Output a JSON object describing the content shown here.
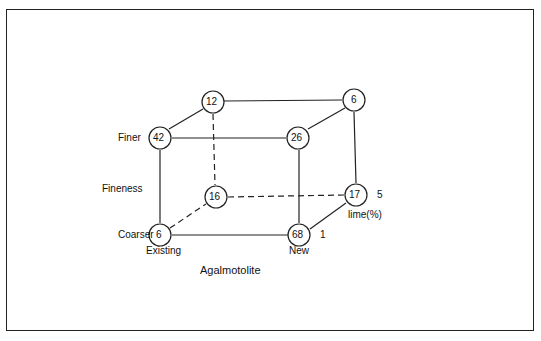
{
  "diagram": {
    "type": "cube-experimental-design",
    "axes": {
      "x": {
        "name": "Agalmotolite",
        "low": "Existing",
        "high": "New"
      },
      "y": {
        "name": "Fineness",
        "low": "Coarser",
        "high": "Finer"
      },
      "z": {
        "name": "lime(%)",
        "low": "1",
        "high": "5"
      }
    },
    "nodes": [
      {
        "id": "front-bottom-left",
        "value": "6"
      },
      {
        "id": "front-bottom-right",
        "value": "68"
      },
      {
        "id": "front-top-left",
        "value": "42"
      },
      {
        "id": "front-top-right",
        "value": "26"
      },
      {
        "id": "back-bottom-left",
        "value": "16"
      },
      {
        "id": "back-bottom-right",
        "value": "17"
      },
      {
        "id": "back-top-left",
        "value": "12"
      },
      {
        "id": "back-top-right",
        "value": "6"
      }
    ],
    "labels": {
      "finer": "Finer",
      "fineness": "Fineness",
      "coarser": "Coarser",
      "existing": "Existing",
      "new": "New",
      "agalmotolite": "Agalmotolite",
      "lime": "lime(%)",
      "lime_low": "1",
      "lime_high": "5"
    }
  }
}
